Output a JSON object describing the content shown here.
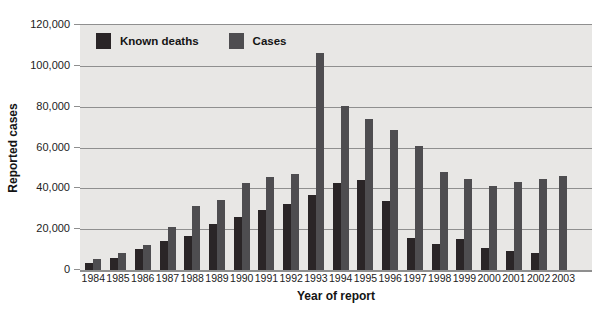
{
  "chart_data": {
    "type": "bar",
    "title": "",
    "xlabel": "Year of report",
    "ylabel": "Reported cases",
    "ylim": [
      0,
      120000
    ],
    "ytick_step": 20000,
    "ytick_labels": [
      "0",
      "20,000",
      "40,000",
      "60,000",
      "80,000",
      "100,000",
      "120,000"
    ],
    "grid": "horizontal-only",
    "legend_position": "inside-top-left",
    "plot_background": "#e8e7e5",
    "gridline_color": "#8f8f8f",
    "categories": [
      "1984",
      "1985",
      "1986",
      "1987",
      "1988",
      "1989",
      "1990",
      "1991",
      "1992",
      "1993",
      "1994",
      "1995",
      "1996",
      "1997",
      "1998",
      "1999",
      "2000",
      "2001",
      "2002",
      "2003"
    ],
    "series": [
      {
        "name": "Known deaths",
        "color": "#2a2527",
        "values": [
          3500,
          6000,
          10500,
          14000,
          16500,
          22500,
          26000,
          29500,
          32500,
          37000,
          42500,
          44000,
          34000,
          15500,
          13000,
          15000,
          11000,
          9500,
          8500,
          null
        ]
      },
      {
        "name": "Cases",
        "color": "#4e4d50",
        "values": [
          5500,
          8500,
          12500,
          21000,
          31500,
          34500,
          42500,
          45500,
          47000,
          106500,
          80500,
          74000,
          68500,
          61000,
          48000,
          44500,
          41000,
          43000,
          44500,
          46000
        ]
      }
    ]
  }
}
